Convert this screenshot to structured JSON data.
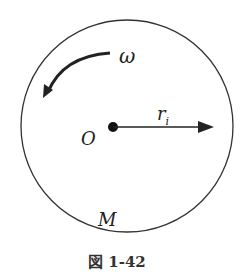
{
  "diagram": {
    "labels": {
      "omega": "ω",
      "radius": "r",
      "radius_sub": "i",
      "center": "O",
      "mass": "M"
    },
    "caption": "図 1-42"
  }
}
